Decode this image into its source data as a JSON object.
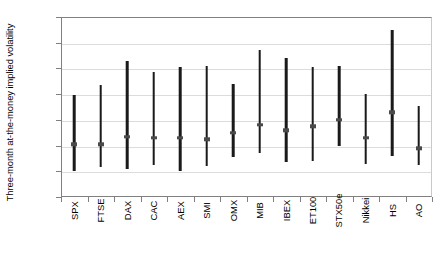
{
  "chart_data": {
    "type": "bar",
    "subtype": "range-with-median",
    "title": "",
    "xlabel": "",
    "ylabel": "Three-month at-the-money implied volatility",
    "ylim": [
      0,
      70
    ],
    "ytick_values": [
      0,
      10,
      20,
      30,
      40,
      50,
      60,
      70
    ],
    "ytick_labels": [
      "0%",
      "10%",
      "20%",
      "30%",
      "40%",
      "50%",
      "60%",
      "70%"
    ],
    "grid": true,
    "grid_axis": "y",
    "legend": false,
    "categories": [
      "SPX",
      "FTSE",
      "DAX",
      "CAC",
      "AEX",
      "SMI",
      "OMX",
      "MIB",
      "IBEX",
      "ET100",
      "STX50e",
      "Nikkei",
      "HS",
      "AO"
    ],
    "series": [
      {
        "name": "Minimum",
        "values": [
          10.0,
          11.5,
          11.0,
          12.5,
          10.0,
          12.0,
          15.5,
          17.0,
          13.5,
          14.0,
          20.0,
          13.0,
          16.0,
          12.5
        ]
      },
      {
        "name": "Median",
        "values": [
          20.5,
          20.5,
          23.5,
          23.0,
          23.0,
          22.5,
          25.0,
          28.0,
          26.0,
          27.5,
          30.0,
          23.0,
          33.0,
          19.0
        ]
      },
      {
        "name": "Maximum",
        "values": [
          39.5,
          43.5,
          53.0,
          48.5,
          50.5,
          51.0,
          44.0,
          57.0,
          54.0,
          50.5,
          51.0,
          40.0,
          65.0,
          35.5
        ]
      }
    ],
    "colors": {
      "bar": "#1a1a1a",
      "median_marker": "#4a4a4a",
      "gridline": "#dcdcdc",
      "axis": "#808080",
      "background": "#ffffff"
    }
  }
}
